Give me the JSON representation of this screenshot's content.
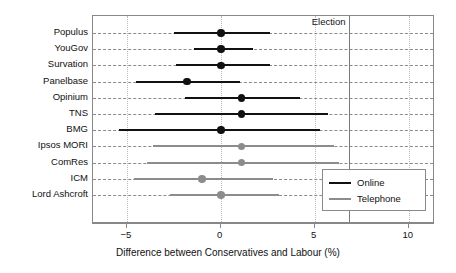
{
  "chart_data": {
    "type": "scatter",
    "title": "",
    "xlabel": "Difference between Conservatives and Labour (%)",
    "ylabel": "",
    "xlim": [
      -6.8,
      11.4
    ],
    "xticks": [
      -5,
      0,
      5,
      10
    ],
    "xtick_labels": [
      "−5",
      "0",
      "5",
      "10"
    ],
    "grid": true,
    "legend_position": "bottom-right",
    "orientation": "horizontal",
    "annotations": [
      {
        "label": "Election",
        "type": "vline",
        "x": 6.8
      }
    ],
    "series": [
      {
        "name": "Online",
        "color": "#111111"
      },
      {
        "name": "Telephone",
        "color": "#8c8c8c"
      }
    ],
    "categories": [
      "Populus",
      "YouGov",
      "Survation",
      "Panelbase",
      "Opinium",
      "TNS",
      "BMG",
      "Ipsos MORI",
      "ComRes",
      "ICM",
      "Lord Ashcroft"
    ],
    "points": [
      {
        "label": "Populus",
        "mode": "Online",
        "estimate": 0.0,
        "low": -2.5,
        "high": 2.6
      },
      {
        "label": "YouGov",
        "mode": "Online",
        "estimate": 0.0,
        "low": -1.4,
        "high": 1.7
      },
      {
        "label": "Survation",
        "mode": "Online",
        "estimate": 0.0,
        "low": -2.4,
        "high": 2.6
      },
      {
        "label": "Panelbase",
        "mode": "Online",
        "estimate": -1.8,
        "low": -4.5,
        "high": 1.0
      },
      {
        "label": "Opinium",
        "mode": "Online",
        "estimate": 1.1,
        "low": -1.9,
        "high": 4.2
      },
      {
        "label": "TNS",
        "mode": "Online",
        "estimate": 1.1,
        "low": -3.5,
        "high": 5.7
      },
      {
        "label": "BMG",
        "mode": "Online",
        "estimate": 0.0,
        "low": -5.4,
        "high": 5.3
      },
      {
        "label": "Ipsos MORI",
        "mode": "Telephone",
        "estimate": 1.1,
        "low": -3.6,
        "high": 6.0
      },
      {
        "label": "ComRes",
        "mode": "Telephone",
        "estimate": 1.1,
        "low": -3.9,
        "high": 6.3
      },
      {
        "label": "ICM",
        "mode": "Telephone",
        "estimate": -1.0,
        "low": -4.6,
        "high": 2.8
      },
      {
        "label": "Lord Ashcroft",
        "mode": "Telephone",
        "estimate": 0.0,
        "low": -2.7,
        "high": 3.1
      }
    ]
  },
  "axis": {
    "x_title": "Difference between Conservatives and Labour (%)",
    "tick_labels": [
      "−5",
      "0",
      "5",
      "10"
    ]
  },
  "annotation": {
    "election_label": "Election"
  },
  "legend": {
    "items": [
      {
        "label": "Online"
      },
      {
        "label": "Telephone"
      }
    ]
  },
  "colors": {
    "online": "#111111",
    "telephone": "#8c8c8c",
    "frame": "#888888",
    "grid": "#777777",
    "election_line": "#7a7a7a",
    "background": "#ffffff"
  }
}
